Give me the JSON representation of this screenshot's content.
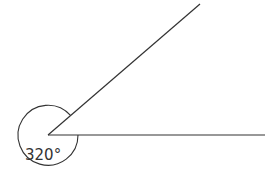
{
  "diagram": {
    "type": "angle",
    "angle_label": "320°",
    "angle_degrees": 320,
    "line_color": "#333333",
    "background": "#ffffff",
    "vertex": [
      48,
      135
    ],
    "ray_horizontal_end": [
      265,
      135
    ],
    "ray_upper_end": [
      200,
      4
    ],
    "arc_radius": 30
  }
}
